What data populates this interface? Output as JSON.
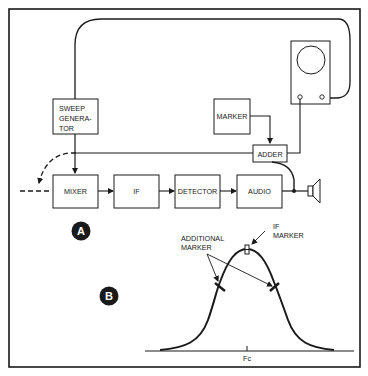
{
  "colors": {
    "ink": "#1a1a1a",
    "paper": "#ffffff"
  },
  "part_a": {
    "badge": "A",
    "blocks": {
      "sweep_generator": [
        "SWEEP",
        "GENERA-",
        "TOR"
      ],
      "marker": "MARKER",
      "adder": "ADDER",
      "mixer": "MIXER",
      "if": "IF",
      "detector": "DETECTOR",
      "audio": "AUDIO"
    },
    "icons": {
      "oscilloscope": "oscilloscope-icon",
      "speaker": "speaker-icon"
    }
  },
  "part_b": {
    "badge": "B",
    "labels": {
      "if_marker": [
        "IF",
        "MARKER"
      ],
      "additional_marker": [
        "ADDITIONAL",
        "MARKER"
      ],
      "center_frequency": "Fc"
    },
    "response_curve": {
      "shape": "bell",
      "markers": [
        {
          "name": "IF marker",
          "position": "peak (Fc)"
        },
        {
          "name": "additional marker",
          "position": "lower skirt"
        },
        {
          "name": "additional marker",
          "position": "upper skirt"
        }
      ]
    }
  }
}
